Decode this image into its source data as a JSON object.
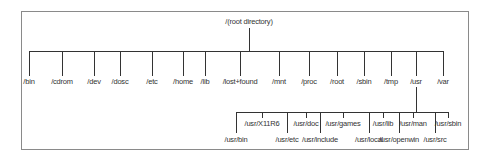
{
  "diagram": {
    "root": {
      "label": "/(root directory)",
      "x": 249,
      "y": 16
    },
    "line_color": "#333333",
    "border_color": "#8a8a8a",
    "top_level": {
      "bar_y": 51,
      "label_y": 77,
      "items": [
        {
          "label": "/bin",
          "x": 29
        },
        {
          "label": "/cdrom",
          "x": 62
        },
        {
          "label": "/dev",
          "x": 94
        },
        {
          "label": "/dosc",
          "x": 120
        },
        {
          "label": "/etc",
          "x": 152
        },
        {
          "label": "/home",
          "x": 183
        },
        {
          "label": "/lib",
          "x": 205
        },
        {
          "label": "/lost+found",
          "x": 240
        },
        {
          "label": "/mnt",
          "x": 279
        },
        {
          "label": "/proc",
          "x": 309
        },
        {
          "label": "/root",
          "x": 337
        },
        {
          "label": "/sbin",
          "x": 364
        },
        {
          "label": "/tmp",
          "x": 391
        },
        {
          "label": "/usr",
          "x": 416
        },
        {
          "label": "/var",
          "x": 443
        }
      ]
    },
    "usr_subtree": {
      "parent": "/usr",
      "bar_y": 112,
      "upper_row": [
        {
          "label": "/usr/X11R6",
          "x": 262
        },
        {
          "label": "/usr/doc",
          "x": 306
        },
        {
          "label": "/usr/games",
          "x": 343
        },
        {
          "label": "/usr/lib",
          "x": 383
        },
        {
          "label": "/usr/man",
          "x": 413
        },
        {
          "label": "/usr/sbin",
          "x": 448
        }
      ],
      "lower_row": [
        {
          "label": "/usr/bin",
          "x": 236
        },
        {
          "label": "/usr/etc",
          "x": 287
        },
        {
          "label": "/usr/include",
          "x": 320
        },
        {
          "label": "/usr/local",
          "x": 369
        },
        {
          "label": "/usr/openwin",
          "x": 399
        },
        {
          "label": "/usr/src",
          "x": 435
        }
      ]
    }
  }
}
